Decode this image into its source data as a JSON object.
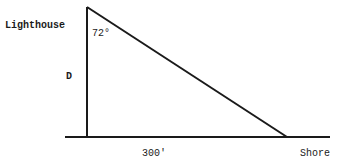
{
  "diagram": {
    "type": "right-triangle",
    "labels": {
      "lighthouse": "Lighthouse",
      "angle": "72°",
      "height": "D",
      "base": "300'",
      "shore": "Shore"
    },
    "values": {
      "angle_degrees": 72,
      "base_length_ft": 300,
      "unknown": "D"
    },
    "colors": {
      "line": "#1a1a1a",
      "background": "#ffffff"
    }
  }
}
